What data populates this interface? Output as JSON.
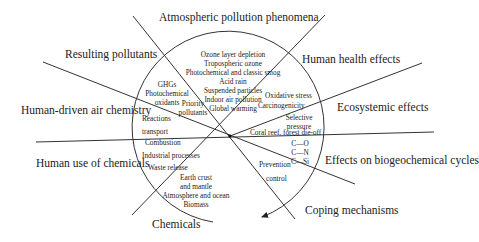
{
  "diagram": {
    "outer_labels": {
      "atmospheric": "Atmospheric pollution phenomena",
      "human_health": "Human health effects",
      "ecosystemic": "Ecosystemic effects",
      "biogeochemical": "Effects on biogeochemical cycles",
      "coping": "Coping mechanisms",
      "chemicals": "Chemicals",
      "human_use": "Human use of chemicals",
      "air_chemistry": "Human-driven air chemistry",
      "resulting": "Resulting pollutants"
    },
    "inner": {
      "atmospheric": [
        "Ozone layer depletion",
        "Tropospheric ozone",
        "Photochemical and classic smog",
        "Acid rain",
        "Suspended particles",
        "Indoor air pollution",
        "Global warming"
      ],
      "resulting": [
        "GHGs",
        "Photochemical",
        "oxidants"
      ],
      "priority": [
        "Priority",
        "pollutants"
      ],
      "health": [
        "Oxidative stress",
        "Carcinogenicity"
      ],
      "selective": [
        "Selective",
        "pressure"
      ],
      "coral": "Coral reef, forest die-off",
      "cycles": [
        "C—O",
        "C—N",
        "C—Si"
      ],
      "coping": [
        "Prevention",
        "control"
      ],
      "chemicals": [
        "Earth crust",
        "and mantle",
        "Atmosphere and ocean",
        "Biomass"
      ],
      "human_use": [
        "Combustion",
        "Industrial processes",
        "Waste release"
      ],
      "air_chemistry": [
        "Reactions",
        "transport"
      ]
    },
    "geometry": {
      "center": [
        230,
        136
      ],
      "radius": 96,
      "line_color": "#333333"
    }
  }
}
